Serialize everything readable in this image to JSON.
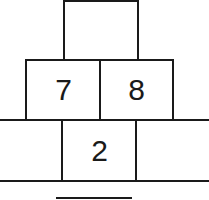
{
  "pyramid": {
    "top": [
      ""
    ],
    "middle": [
      "7",
      "8"
    ],
    "bottom": [
      "",
      "2",
      ""
    ]
  },
  "answer_line": ""
}
